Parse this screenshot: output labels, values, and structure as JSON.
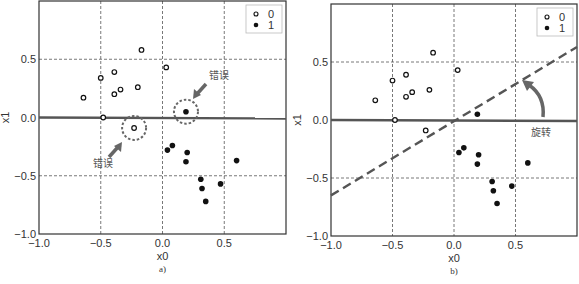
{
  "chart_data": [
    {
      "type": "scatter",
      "panel_label": "a)",
      "title": "",
      "xlabel": "x0",
      "ylabel": "x1",
      "xlim": [
        -1.0,
        1.0
      ],
      "ylim": [
        -1.0,
        1.0
      ],
      "xticks": [
        "-1.0",
        "-0.5",
        "0.0",
        "0.5"
      ],
      "yticks": [
        "-1.0",
        "-0.5",
        "0.0",
        "0.5"
      ],
      "grid": true,
      "legend": {
        "position": "upper right",
        "entries": [
          "0",
          "1"
        ]
      },
      "series": [
        {
          "name": "0",
          "marker": "open-circle",
          "points": [
            [
              -0.64,
              0.17
            ],
            [
              -0.5,
              0.34
            ],
            [
              -0.39,
              0.39
            ],
            [
              -0.34,
              0.24
            ],
            [
              -0.39,
              0.2
            ],
            [
              -0.2,
              0.26
            ],
            [
              -0.17,
              0.58
            ],
            [
              0.03,
              0.43
            ],
            [
              -0.48,
              0.0
            ],
            [
              -0.23,
              -0.09
            ]
          ]
        },
        {
          "name": "1",
          "marker": "filled-circle",
          "points": [
            [
              0.19,
              0.05
            ],
            [
              0.04,
              -0.28
            ],
            [
              0.08,
              -0.24
            ],
            [
              0.2,
              -0.3
            ],
            [
              0.19,
              -0.38
            ],
            [
              0.31,
              -0.53
            ],
            [
              0.32,
              -0.61
            ],
            [
              0.35,
              -0.72
            ],
            [
              0.47,
              -0.57
            ],
            [
              0.6,
              -0.37
            ]
          ]
        }
      ],
      "decision_boundary": {
        "type": "horizontal",
        "y": 0.0
      },
      "annotations": [
        {
          "text": "错误",
          "target": [
            0.19,
            0.05
          ],
          "note": "dashed circle, arrow from upper right"
        },
        {
          "text": "错误",
          "target": [
            -0.23,
            -0.09
          ],
          "note": "dashed circle, arrow from lower left"
        }
      ]
    },
    {
      "type": "scatter",
      "panel_label": "b)",
      "title": "",
      "xlabel": "x0",
      "ylabel": "x1",
      "xlim": [
        -1.0,
        1.0
      ],
      "ylim": [
        -1.0,
        1.0
      ],
      "xticks": [
        "-1.0",
        "-0.5",
        "0.0",
        "0.5"
      ],
      "yticks": [
        "-1.0",
        "-0.5",
        "0.0",
        "0.5"
      ],
      "grid": true,
      "legend": {
        "position": "upper right",
        "entries": [
          "0",
          "1"
        ]
      },
      "series": [
        {
          "name": "0",
          "marker": "open-circle",
          "points": [
            [
              -0.64,
              0.17
            ],
            [
              -0.5,
              0.34
            ],
            [
              -0.39,
              0.39
            ],
            [
              -0.34,
              0.24
            ],
            [
              -0.39,
              0.2
            ],
            [
              -0.2,
              0.26
            ],
            [
              -0.17,
              0.58
            ],
            [
              0.03,
              0.43
            ],
            [
              -0.48,
              0.0
            ],
            [
              -0.23,
              -0.09
            ]
          ]
        },
        {
          "name": "1",
          "marker": "filled-circle",
          "points": [
            [
              0.19,
              0.05
            ],
            [
              0.04,
              -0.28
            ],
            [
              0.08,
              -0.24
            ],
            [
              0.2,
              -0.3
            ],
            [
              0.19,
              -0.38
            ],
            [
              0.31,
              -0.53
            ],
            [
              0.32,
              -0.61
            ],
            [
              0.35,
              -0.72
            ],
            [
              0.47,
              -0.57
            ],
            [
              0.6,
              -0.37
            ]
          ]
        }
      ],
      "decision_boundary": {
        "type": "horizontal",
        "y": 0.0
      },
      "rotated_boundary": {
        "style": "dashed",
        "from": [
          -1.0,
          -0.65
        ],
        "to": [
          1.0,
          0.63
        ]
      },
      "annotations": [
        {
          "text": "旋转",
          "note": "curved arrow rotating boundary counter-clockwise"
        }
      ]
    }
  ],
  "labels": {
    "a_xlabel": "x0",
    "a_ylabel": "x1",
    "a_panel": "a)",
    "b_xlabel": "x0",
    "b_ylabel": "x1",
    "b_panel": "b)",
    "legend_0": "0",
    "legend_1": "1",
    "error": "错误",
    "rotate": "旋转",
    "ticks": [
      "-1.0",
      "-0.5",
      "0.0",
      "0.5"
    ]
  },
  "colors": {
    "axis": "#333333",
    "grid": "#555555",
    "boundary": "#555555",
    "annotation": "#666666",
    "point": "#111111"
  }
}
